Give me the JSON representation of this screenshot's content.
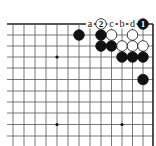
{
  "diagram": {
    "type": "go-board-partial",
    "corner": "top-right",
    "grid": {
      "cols_x": [
        13,
        24,
        35,
        46,
        57,
        68,
        79,
        90,
        101,
        111.5,
        122,
        132.5,
        143,
        153
      ],
      "rows_y": [
        24,
        35,
        46,
        57,
        68,
        79.5,
        91,
        102,
        113,
        124.5,
        136
      ],
      "left_extend_to": 7,
      "bottom_extend_to": 146,
      "line_color": "#555555",
      "edge_color": "#222222"
    },
    "star_points": [
      {
        "col": 4,
        "row": 3
      },
      {
        "col": 4,
        "row": 9
      },
      {
        "col": 10,
        "row": 9
      }
    ],
    "stones": [
      {
        "color": "black",
        "col": 6,
        "row": 1
      },
      {
        "color": "black",
        "col": 8,
        "row": 1
      },
      {
        "color": "white",
        "col": 9,
        "row": 1
      },
      {
        "color": "white",
        "col": 11,
        "row": 1
      },
      {
        "color": "black",
        "col": 8,
        "row": 2
      },
      {
        "color": "black",
        "col": 9,
        "row": 2
      },
      {
        "color": "white",
        "col": 10,
        "row": 2
      },
      {
        "color": "white",
        "col": 11,
        "row": 2
      },
      {
        "color": "white",
        "col": 12,
        "row": 2
      },
      {
        "color": "black",
        "col": 10,
        "row": 3
      },
      {
        "color": "black",
        "col": 11,
        "row": 3
      },
      {
        "color": "black",
        "col": 12,
        "row": 3
      },
      {
        "color": "black",
        "col": 12,
        "row": 5
      }
    ],
    "numbered_stones": [
      {
        "color": "black",
        "col": 12,
        "row": 0,
        "label": "1"
      },
      {
        "color": "white",
        "col": 8,
        "row": 0,
        "label": "2"
      }
    ],
    "letter_marks": [
      {
        "col": 7,
        "row": 0,
        "label": "a"
      },
      {
        "col": 9,
        "row": 0,
        "label": "c"
      },
      {
        "col": 10,
        "row": 0,
        "label": "b"
      },
      {
        "col": 11,
        "row": 0,
        "label": "d"
      }
    ],
    "colors": {
      "black_stone": "#111111",
      "white_stone": "#ffffff",
      "stone_outline": "#111111",
      "background": "#ffffff"
    }
  }
}
